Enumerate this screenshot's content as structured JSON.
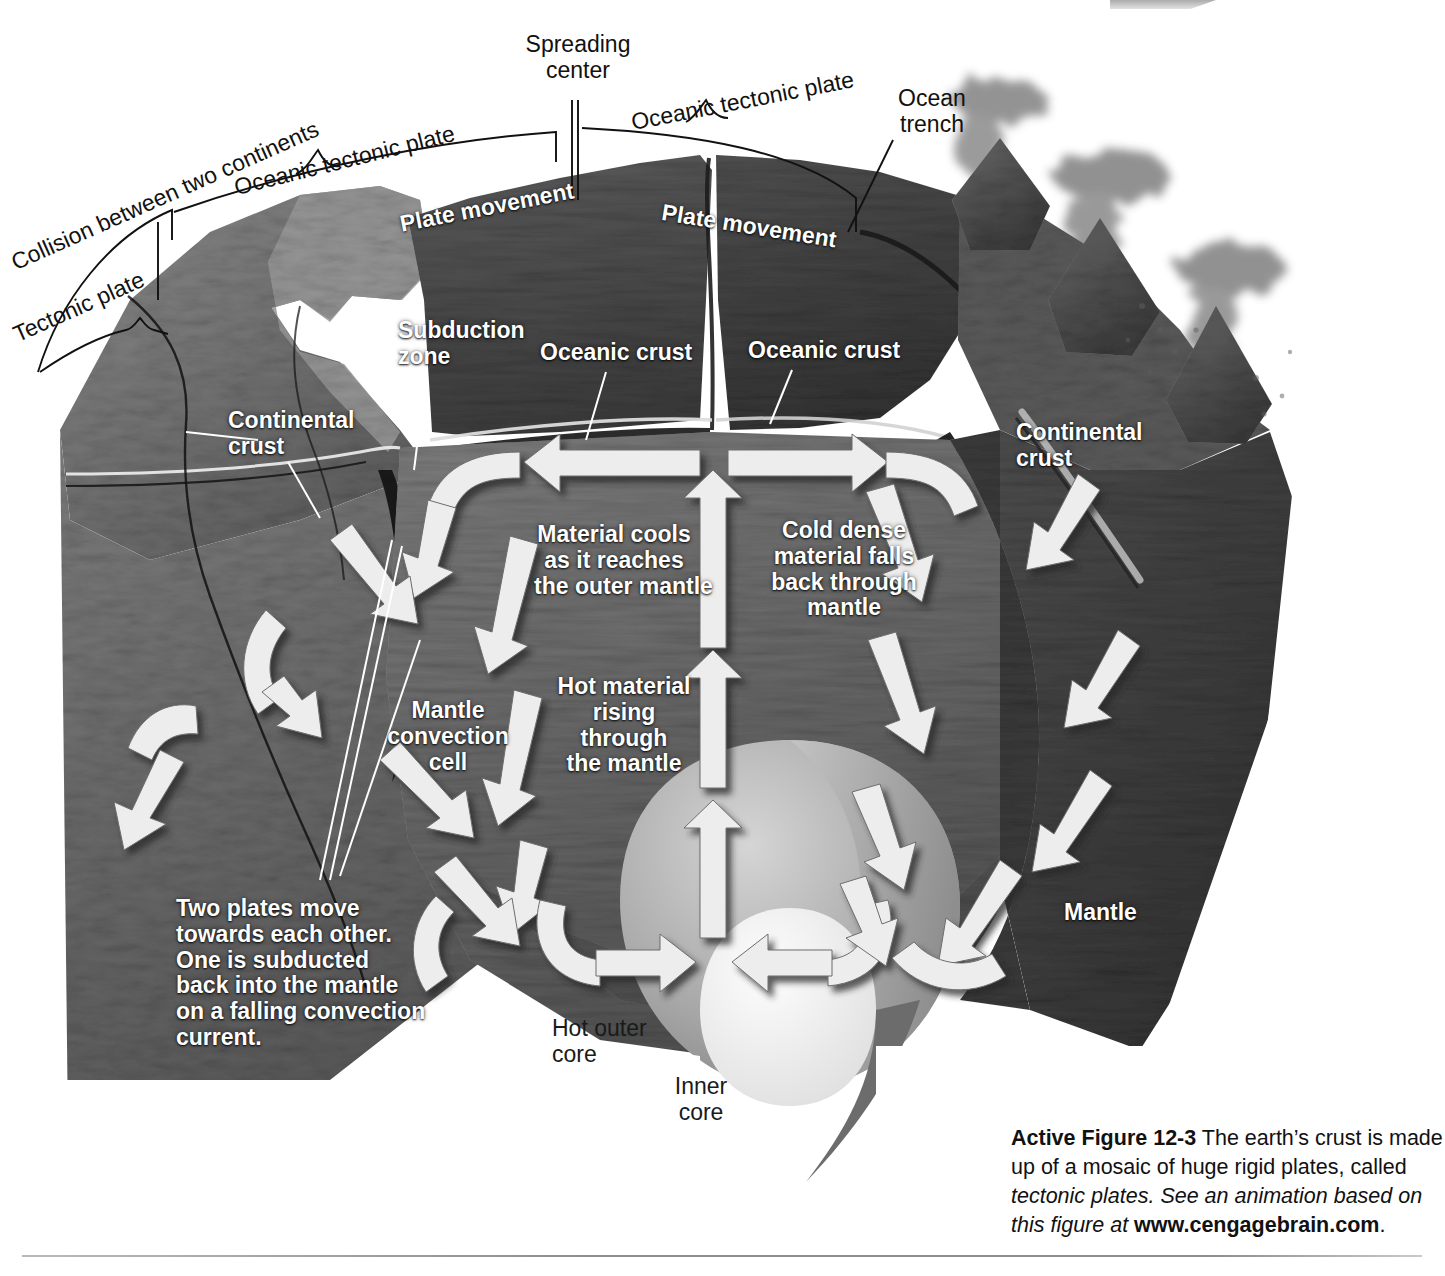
{
  "figure": {
    "background_color": "#ffffff"
  },
  "callouts": [
    {
      "name": "collision-between-two-continents",
      "text": "Collision between two continents"
    },
    {
      "name": "tectonic-plate",
      "text": "Tectonic plate"
    },
    {
      "name": "oceanic-tectonic-plate-left",
      "text": "Oceanic tectonic plate"
    },
    {
      "name": "spreading-center",
      "text": "Spreading\ncenter"
    },
    {
      "name": "oceanic-tectonic-plate-right",
      "text": "Oceanic tectonic plate"
    },
    {
      "name": "ocean-trench",
      "text": "Ocean\ntrench"
    }
  ],
  "surface_labels": [
    {
      "name": "plate-movement-left",
      "text": "Plate movement"
    },
    {
      "name": "plate-movement-right",
      "text": "Plate movement"
    },
    {
      "name": "subduction-zone",
      "text": "Subduction\nzone"
    },
    {
      "name": "oceanic-crust-left",
      "text": "Oceanic crust"
    },
    {
      "name": "oceanic-crust-right",
      "text": "Oceanic crust"
    },
    {
      "name": "continental-crust-left",
      "text": "Continental\ncrust"
    },
    {
      "name": "continental-crust-right",
      "text": "Continental\ncrust"
    }
  ],
  "mantle_labels": [
    {
      "name": "material-cools",
      "text": "Material cools\nas it reaches\nthe outer mantle"
    },
    {
      "name": "cold-dense-falls",
      "text": "Cold dense\nmaterial falls\nback through\nmantle"
    },
    {
      "name": "hot-material-rising",
      "text": "Hot material\nrising\nthrough\nthe mantle"
    },
    {
      "name": "mantle-convection-cell",
      "text": "Mantle\nconvection\ncell"
    },
    {
      "name": "two-plates-move",
      "text": "Two plates move\ntowards each other.\nOne is subducted\nback into the mantle\non a falling convection\ncurrent."
    },
    {
      "name": "mantle",
      "text": "Mantle"
    }
  ],
  "core_labels": [
    {
      "name": "hot-outer-core",
      "text": "Hot outer\ncore"
    },
    {
      "name": "inner-core",
      "text": "Inner\ncore"
    }
  ],
  "caption": {
    "figure_number": "Active Figure 12-3",
    "sentence_1": " The earth’s crust is made up of a mosaic of huge rigid plates, called ",
    "italic_1": "tectonic plates.",
    "italic_2": " See an animation based on this figure at ",
    "url": "www.cengagebrain.com",
    "period": "."
  },
  "colors": {
    "page": "#ffffff",
    "arrow_fill": "#ececec",
    "arrow_shadow": "#4a4a4a",
    "crust_dark": "#3a3a3a",
    "mantle_mid": "#6e6e6e",
    "mantle_deep": "#545454",
    "outer_core": "#9d9d9d",
    "inner_core": "#efefef",
    "rule": "#8e8e8e",
    "label_white": "#ffffff",
    "label_dark": "#111111"
  }
}
